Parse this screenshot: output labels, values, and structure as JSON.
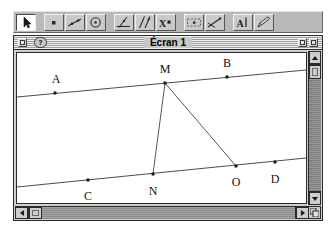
{
  "app": {
    "name": "geometry-app",
    "background": "#ffffff",
    "toolbar_bg": "#b9b9b9",
    "window_bg": "#cfcfcf",
    "canvas_bg": "#ffffff",
    "line_color": "#4c4c5a",
    "label_color": "#111111",
    "frame_color": "#2a2a2a"
  },
  "toolbar": {
    "name": "tool-palette",
    "buttons": [
      {
        "icon": "pointer-arrow-icon",
        "label": "Pointeur",
        "selected": true
      },
      {
        "icon": "point-icon",
        "label": "Point",
        "selected": false
      },
      {
        "icon": "line-icon",
        "label": "Droite",
        "selected": false
      },
      {
        "icon": "circle-icon",
        "label": "Cercle",
        "selected": false
      },
      {
        "icon": "perpendicular-line-icon",
        "label": "Perpendiculaire",
        "selected": false
      },
      {
        "icon": "parallel-line-icon",
        "label": "Parallele",
        "selected": false
      },
      {
        "icon": "x-point-icon",
        "label": "Intersection",
        "selected": false
      },
      {
        "icon": "measure-icon",
        "label": "Mesure",
        "selected": false
      },
      {
        "icon": "transform-icon",
        "label": "Transformation",
        "selected": false
      },
      {
        "icon": "text-tool-icon",
        "label": "Texte",
        "selected": false
      },
      {
        "icon": "pencil-edit-icon",
        "label": "Aspect",
        "selected": false
      }
    ]
  },
  "window": {
    "name": "document-window",
    "title": "Écran 1",
    "badge": "?",
    "close_box_label": "Fermer",
    "zoom_box_label": "Agrandir",
    "collapse_box_label": "Réduire"
  },
  "canvas": {
    "name": "geometry-canvas",
    "width": 289,
    "height": 150,
    "lines": [
      {
        "name": "line-AB",
        "x1": 0,
        "y1": 44,
        "x2": 289,
        "y2": 17
      },
      {
        "name": "line-CD",
        "x1": 0,
        "y1": 134,
        "x2": 289,
        "y2": 105
      }
    ],
    "segments": [
      {
        "name": "segment-MN",
        "x1": 148,
        "y1": 30,
        "x2": 136,
        "y2": 121
      },
      {
        "name": "segment-MO",
        "x1": 148,
        "y1": 30,
        "x2": 219,
        "y2": 113
      }
    ],
    "points": [
      {
        "name": "point-A",
        "x": 38,
        "y": 40,
        "label": "A",
        "lx": 39,
        "ly": 30
      },
      {
        "name": "point-M",
        "x": 148,
        "y": 30,
        "label": "M",
        "lx": 148,
        "ly": 20
      },
      {
        "name": "point-B",
        "x": 210,
        "y": 24,
        "label": "B",
        "lx": 210,
        "ly": 14
      },
      {
        "name": "point-C",
        "x": 71,
        "y": 127,
        "label": "C",
        "lx": 71,
        "ly": 147
      },
      {
        "name": "point-N",
        "x": 136,
        "y": 121,
        "label": "N",
        "lx": 136,
        "ly": 142
      },
      {
        "name": "point-O",
        "x": 219,
        "y": 113,
        "label": "O",
        "lx": 219,
        "ly": 133
      },
      {
        "name": "point-D",
        "x": 258,
        "y": 109,
        "label": "D",
        "lx": 258,
        "ly": 130
      }
    ]
  },
  "scrollbars": {
    "vertical": {
      "name": "vertical-scrollbar",
      "up_label": "Haut",
      "down_label": "Bas",
      "thumb_position_percent": 2
    },
    "horizontal": {
      "name": "horizontal-scrollbar",
      "left_label": "Gauche",
      "right_label": "Droite",
      "thumb_position_percent": 0
    },
    "grow_box_label": "Redimensionner"
  }
}
